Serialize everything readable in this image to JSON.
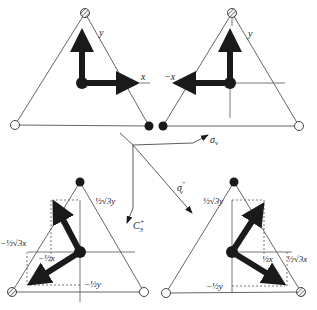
{
  "colors": {
    "ink": "#1a1a1a",
    "line": "#555555",
    "background": "#ffffff"
  },
  "panels": [
    {
      "id": "identity",
      "labels": {
        "x": "x",
        "y": "y"
      }
    },
    {
      "id": "sigma_v",
      "labels": {
        "x": "−x",
        "y": "y"
      }
    },
    {
      "id": "c3",
      "labels": {
        "a": "½√3y",
        "b": "−½√3x",
        "c": "−½x",
        "d": "−½y"
      }
    },
    {
      "id": "sigma_v2",
      "labels": {
        "a": "½√3y",
        "b": "½x",
        "c": "½√3x",
        "d": "−½y"
      }
    }
  ],
  "operations": {
    "sigma_v": "σ",
    "sigma_v_sub": "v",
    "sigma_v2": "σ",
    "sigma_v2_sub": "v",
    "sigma_v2_sup": "″",
    "c3": "C",
    "c3_sub": "3",
    "c3_sup": "+"
  }
}
